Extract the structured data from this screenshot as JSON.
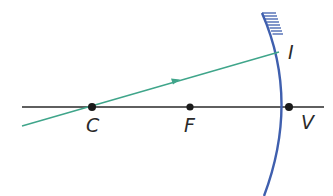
{
  "diagram": {
    "type": "concave-mirror-ray-diagram",
    "colors": {
      "background": "#ffffff",
      "axis": "#2a2a2a",
      "points": "#1a1a1a",
      "mirror": "#3f5fae",
      "ray": "#3fa58a",
      "labels": "#2a2a2a"
    },
    "principal_axis": {
      "x1": 22,
      "y1": 107,
      "x2": 324,
      "y2": 107
    },
    "points": [
      {
        "id": "C",
        "label": "C",
        "x": 92,
        "y": 107,
        "label_x": 86,
        "label_y": 132
      },
      {
        "id": "F",
        "label": "F",
        "x": 190,
        "y": 107,
        "label_x": 184,
        "label_y": 132
      },
      {
        "id": "V",
        "label": "V",
        "x": 289,
        "y": 107,
        "label_x": 301,
        "label_y": 129
      }
    ],
    "incidence_point": {
      "label": "I",
      "x": 279,
      "y": 52,
      "label_x": 288,
      "label_y": 59
    },
    "ray": {
      "x1": 22,
      "y1": 126,
      "x2": 279,
      "y2": 52,
      "arrow_at": 0.61
    },
    "mirror": {
      "path": "M 262 13 Q 300 100 264 196",
      "hatching": "reflective back (top segment)"
    }
  }
}
